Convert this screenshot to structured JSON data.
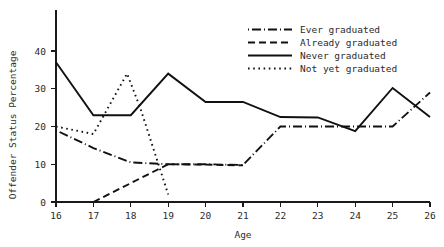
{
  "chart_data": {
    "type": "line",
    "title": "",
    "xlabel": "Age",
    "ylabel": "Offender Status Percentage",
    "x": [
      16,
      17,
      18,
      19,
      20,
      21,
      22,
      23,
      24,
      25,
      26
    ],
    "xlim": [
      16,
      26
    ],
    "ylim": [
      0,
      44
    ],
    "xticks": [
      "16",
      "17",
      "18",
      "19",
      "20",
      "21",
      "22",
      "23",
      "24",
      "25",
      "26"
    ],
    "yticks": [
      "0",
      "10",
      "20",
      "30",
      "40"
    ],
    "ytick_values": [
      0,
      10,
      20,
      30,
      40
    ],
    "grid": false,
    "legend_position": "top-right",
    "series": [
      {
        "name": "Ever graduated",
        "style": "dash-dot",
        "dash_pattern": "1,3,9,3",
        "x": [
          16,
          17,
          18,
          19,
          20,
          21,
          22,
          23,
          24,
          25,
          26
        ],
        "values": [
          19.0,
          14.3,
          10.5,
          10.0,
          10.0,
          9.8,
          20.0,
          20.0,
          20.0,
          20.0,
          29.0
        ]
      },
      {
        "name": "Already graduated",
        "style": "dashed",
        "dash_pattern": "7,4",
        "x": [
          17,
          18,
          19,
          20,
          21
        ],
        "values": [
          0.0,
          5.0,
          10.0,
          9.9,
          9.7
        ]
      },
      {
        "name": "Never graduated",
        "style": "solid",
        "dash_pattern": "none",
        "x": [
          16,
          17,
          18,
          19,
          20,
          21,
          22,
          23,
          24,
          25,
          26
        ],
        "values": [
          37.0,
          23.0,
          23.0,
          34.0,
          26.5,
          26.5,
          22.5,
          22.4,
          18.8,
          30.2,
          22.5
        ]
      },
      {
        "name": "Not yet graduated",
        "style": "dotted",
        "dash_pattern": "1.6,3.6",
        "x": [
          16,
          17,
          17.9,
          18.25,
          19
        ],
        "values": [
          20.0,
          18.0,
          34.0,
          25.0,
          2.0
        ]
      }
    ]
  },
  "legend": {
    "items": [
      {
        "label": "Ever graduated"
      },
      {
        "label": "Already graduated"
      },
      {
        "label": "Never graduated"
      },
      {
        "label": "Not yet graduated"
      }
    ]
  },
  "colors": {
    "ink": "#111111",
    "axis": "#1a1a1a",
    "text": "#2b2b2b",
    "background": "#ffffff"
  }
}
